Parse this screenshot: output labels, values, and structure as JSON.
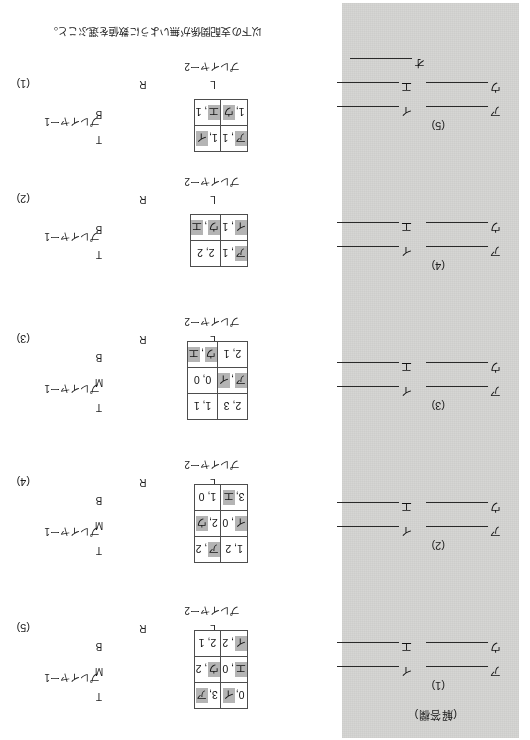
{
  "page": {
    "prompt": "以下の支配関係が無いように数値を選ぶこと。",
    "answer_sheet_label": "(解答欄)",
    "player1_label": "プレイヤー1",
    "player2_label": "プレイヤー2",
    "column_headers": [
      "L",
      "R"
    ],
    "blank_symbols": [
      "ア",
      "イ",
      "ウ",
      "エ",
      "オ"
    ]
  },
  "answer_sections": [
    {
      "number": "(1)",
      "rows": [
        [
          "ア",
          "イ"
        ],
        [
          "ウ",
          "エ"
        ]
      ]
    },
    {
      "number": "(2)",
      "rows": [
        [
          "ア",
          "イ"
        ],
        [
          "ウ",
          "エ"
        ]
      ]
    },
    {
      "number": "(3)",
      "rows": [
        [
          "ア",
          "イ"
        ],
        [
          "ウ",
          "エ"
        ]
      ]
    },
    {
      "number": "(4)",
      "rows": [
        [
          "ア",
          "イ"
        ],
        [
          "ウ",
          "エ"
        ]
      ]
    },
    {
      "number": "(5)",
      "rows": [
        [
          "ア",
          "イ"
        ],
        [
          "ウ",
          "エ"
        ],
        [
          "オ"
        ]
      ]
    }
  ],
  "questions": [
    {
      "number": "(1)",
      "row_headers": [
        "T",
        "B"
      ],
      "cells": [
        [
          {
            "text": "ア, 1",
            "tokens": [
              {
                "t": "ア",
                "hl": true
              },
              {
                "t": ", 1",
                "hl": false
              }
            ]
          },
          {
            "text": "1, イ",
            "tokens": [
              {
                "t": "1, ",
                "hl": false
              },
              {
                "t": "イ",
                "hl": true
              }
            ]
          }
        ],
        [
          {
            "text": "1, ウ",
            "tokens": [
              {
                "t": "1, ",
                "hl": false
              },
              {
                "t": "ウ",
                "hl": true
              }
            ]
          },
          {
            "text": "エ, 1",
            "tokens": [
              {
                "t": "エ",
                "hl": true
              },
              {
                "t": ", 1",
                "hl": false
              }
            ]
          }
        ]
      ]
    },
    {
      "number": "(2)",
      "row_headers": [
        "T",
        "B"
      ],
      "cells": [
        [
          {
            "text": "ア, 1",
            "tokens": [
              {
                "t": "ア",
                "hl": true
              },
              {
                "t": ", 1",
                "hl": false
              }
            ]
          },
          {
            "text": "2, 2",
            "tokens": [
              {
                "t": "2, 2",
                "hl": false
              }
            ]
          }
        ],
        [
          {
            "text": "イ, 1",
            "tokens": [
              {
                "t": "イ",
                "hl": true
              },
              {
                "t": ", 1",
                "hl": false
              }
            ]
          },
          {
            "text": "ウ, エ",
            "tokens": [
              {
                "t": "ウ",
                "hl": true
              },
              {
                "t": ", ",
                "hl": false
              },
              {
                "t": "エ",
                "hl": true
              }
            ]
          }
        ]
      ]
    },
    {
      "number": "(3)",
      "row_headers": [
        "T",
        "M",
        "B"
      ],
      "cells": [
        [
          {
            "text": "2, 3",
            "tokens": [
              {
                "t": "2, 3",
                "hl": false
              }
            ]
          },
          {
            "text": "1, 1",
            "tokens": [
              {
                "t": "1, 1",
                "hl": false
              }
            ]
          }
        ],
        [
          {
            "text": "ア, イ",
            "tokens": [
              {
                "t": "ア",
                "hl": true
              },
              {
                "t": ", ",
                "hl": false
              },
              {
                "t": "イ",
                "hl": true
              }
            ]
          },
          {
            "text": "0, 0",
            "tokens": [
              {
                "t": "0, 0",
                "hl": false
              }
            ]
          }
        ],
        [
          {
            "text": "2, 1",
            "tokens": [
              {
                "t": "2, 1",
                "hl": false
              }
            ]
          },
          {
            "text": "ウ, エ",
            "tokens": [
              {
                "t": "ウ",
                "hl": true
              },
              {
                "t": ", ",
                "hl": false
              },
              {
                "t": "エ",
                "hl": true
              }
            ]
          }
        ]
      ]
    },
    {
      "number": "(4)",
      "row_headers": [
        "T",
        "M",
        "B"
      ],
      "cells": [
        [
          {
            "text": "1, 2",
            "tokens": [
              {
                "t": "1, 2",
                "hl": false
              }
            ]
          },
          {
            "text": "ア, 2",
            "tokens": [
              {
                "t": "ア",
                "hl": true
              },
              {
                "t": ", 2",
                "hl": false
              }
            ]
          }
        ],
        [
          {
            "text": "イ, 0",
            "tokens": [
              {
                "t": "イ",
                "hl": true
              },
              {
                "t": ", 0",
                "hl": false
              }
            ]
          },
          {
            "text": "2, ウ",
            "tokens": [
              {
                "t": "2, ",
                "hl": false
              },
              {
                "t": "ウ",
                "hl": true
              }
            ]
          }
        ],
        [
          {
            "text": "3, エ",
            "tokens": [
              {
                "t": "3, ",
                "hl": false
              },
              {
                "t": "エ",
                "hl": true
              }
            ]
          },
          {
            "text": "1, 0",
            "tokens": [
              {
                "t": "1, 0",
                "hl": false
              }
            ]
          }
        ]
      ]
    },
    {
      "number": "(5)",
      "row_headers": [
        "T",
        "M",
        "B"
      ],
      "cells": [
        [
          {
            "text": "0, イ",
            "tokens": [
              {
                "t": "0, ",
                "hl": false
              },
              {
                "t": "イ",
                "hl": true
              }
            ]
          },
          {
            "text": "3, ア",
            "tokens": [
              {
                "t": "3, ",
                "hl": false
              },
              {
                "t": "ア",
                "hl": true
              }
            ]
          }
        ],
        [
          {
            "text": "エ, 0",
            "tokens": [
              {
                "t": "エ",
                "hl": true
              },
              {
                "t": ", 0",
                "hl": false
              }
            ]
          },
          {
            "text": "ウ, 2",
            "tokens": [
              {
                "t": "ウ",
                "hl": true
              },
              {
                "t": ", 2",
                "hl": false
              }
            ]
          }
        ],
        [
          {
            "text": "イ, 2",
            "tokens": [
              {
                "t": "イ",
                "hl": true
              },
              {
                "t": ", 2",
                "hl": false
              }
            ]
          },
          {
            "text": "2, 1",
            "tokens": [
              {
                "t": "2, 1",
                "hl": false
              }
            ]
          }
        ]
      ]
    }
  ]
}
